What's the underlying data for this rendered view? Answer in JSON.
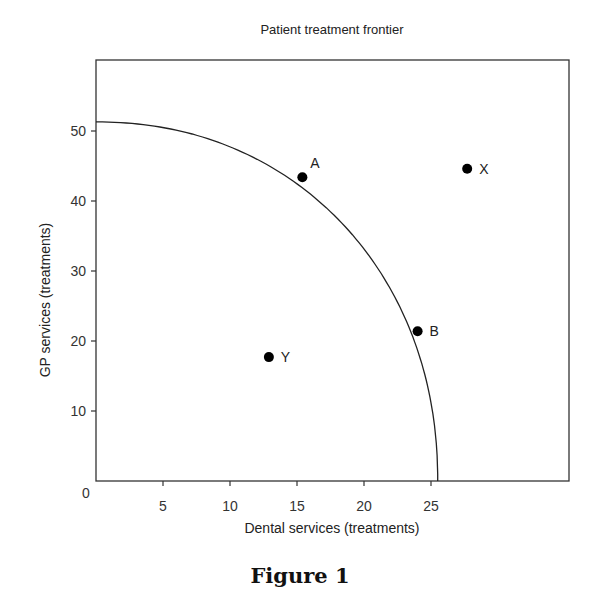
{
  "chart_data": {
    "type": "scatter",
    "title": "Patient treatment frontier",
    "xlabel": "Dental services (treatments)",
    "ylabel": "GP services (treatments)",
    "xlim": [
      0,
      35
    ],
    "ylim": [
      0,
      60
    ],
    "origin_label": "0",
    "x_ticks": [
      5,
      10,
      15,
      20,
      25
    ],
    "y_ticks": [
      10,
      20,
      30,
      40,
      50
    ],
    "grid": false,
    "legend": null,
    "frontier_curve": {
      "description": "Concave production possibility frontier",
      "y_intercept": 51.3,
      "x_intercept": 25.5
    },
    "points": [
      {
        "label": "A",
        "x": 15.4,
        "y": 43.4
      },
      {
        "label": "B",
        "x": 24.0,
        "y": 21.4
      },
      {
        "label": "X",
        "x": 27.7,
        "y": 44.6
      },
      {
        "label": "Y",
        "x": 12.9,
        "y": 17.7
      }
    ]
  },
  "caption": "Figure 1",
  "colors": {
    "line": "#222222",
    "point": "#000000",
    "frame": "#333333"
  }
}
